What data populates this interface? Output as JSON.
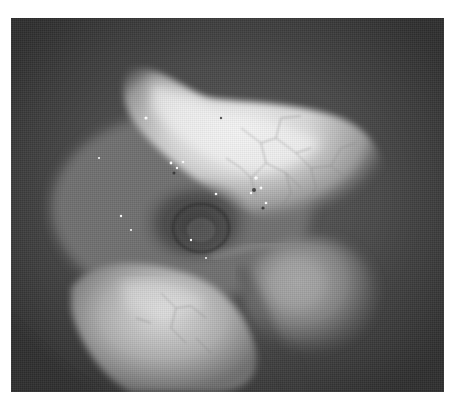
{
  "image": {
    "kind": "grayscale endoscopic photograph",
    "frame_color": "#ffffff",
    "background_tone": "#3a3a3a",
    "highlight_tone": "#f2f2f2",
    "regions": [
      {
        "name": "bright-upper-tissue",
        "description": "bright membrane-covered tissue with fine vessel network"
      },
      {
        "name": "dark-central-cavity",
        "description": "dark opening with specular highlights"
      },
      {
        "name": "lower-left-lobe",
        "description": "large rounded pale lobe"
      },
      {
        "name": "lower-right-lobe",
        "description": "smaller rounded mid-gray lobe"
      }
    ]
  }
}
